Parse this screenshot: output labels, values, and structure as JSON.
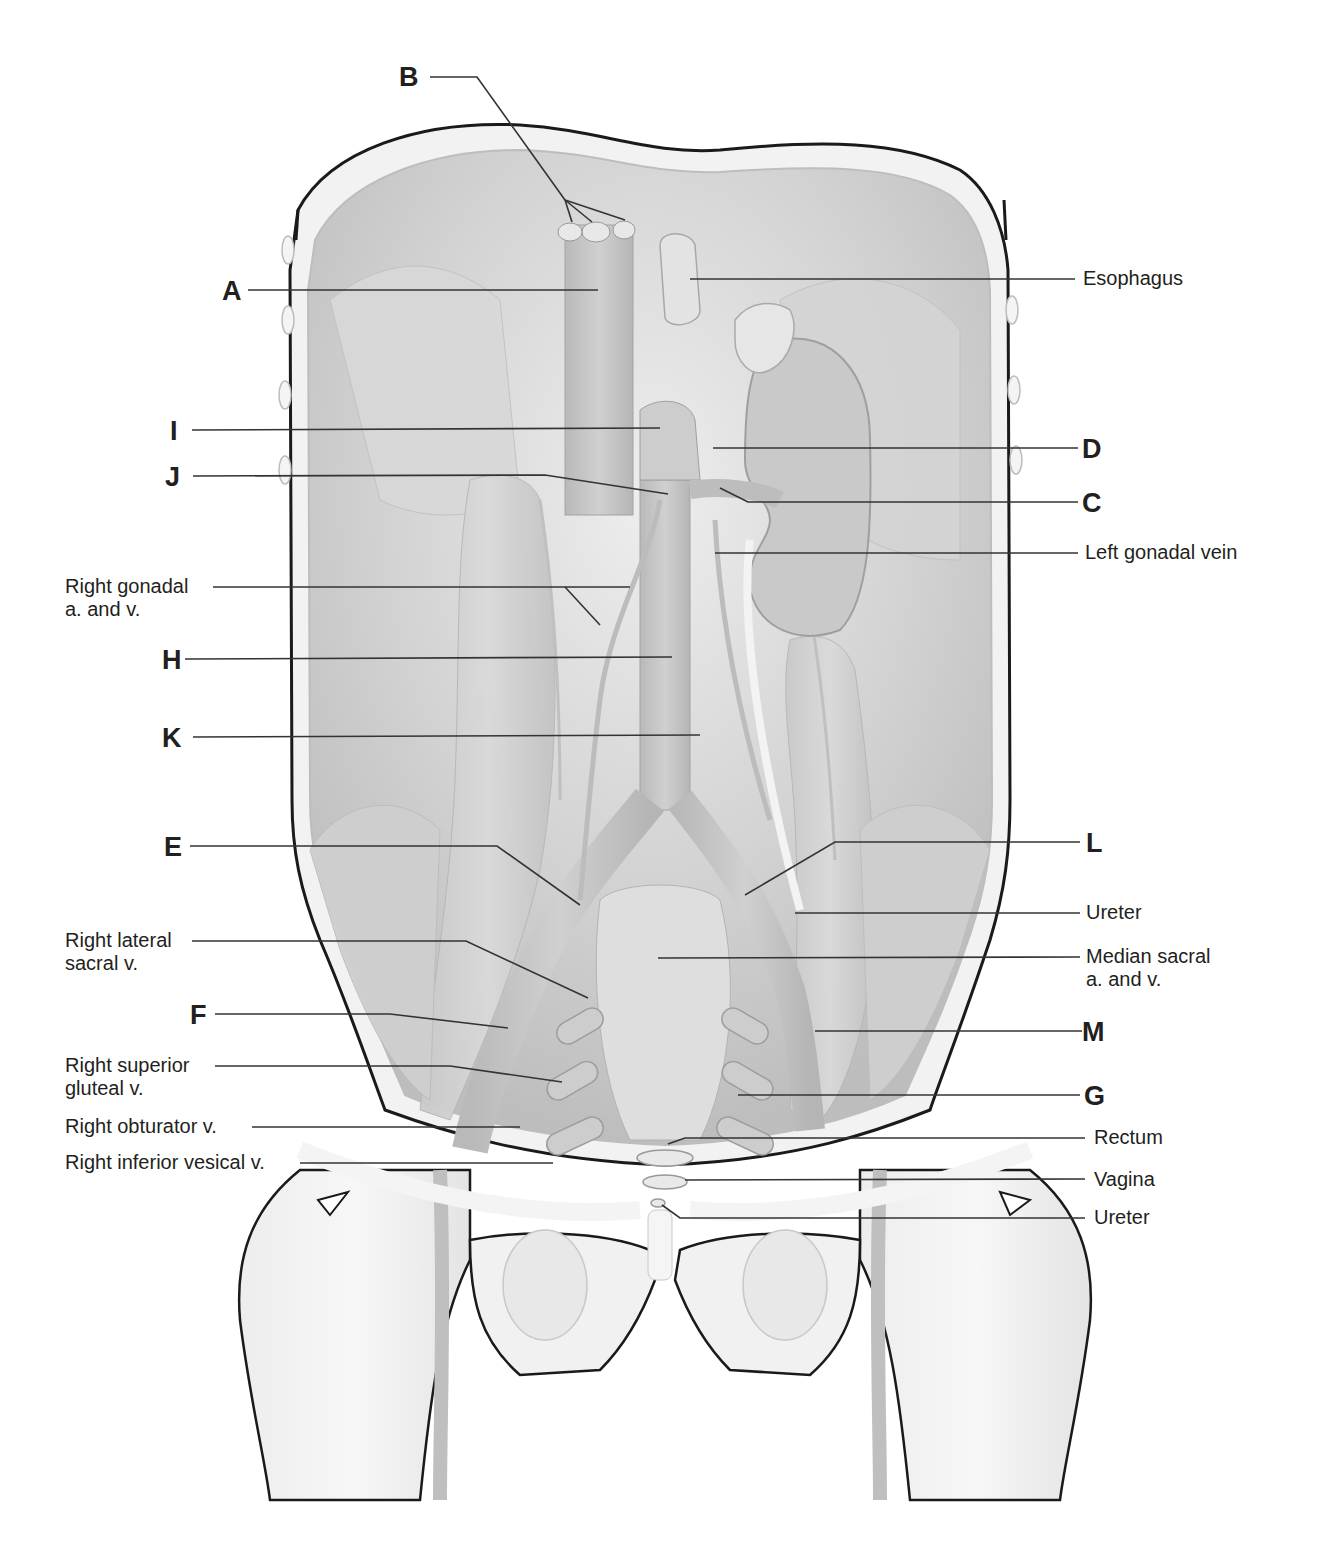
{
  "figure": {
    "colors": {
      "background": "#ffffff",
      "outline": "#1a1a1a",
      "tissue_light": "#e6e6e6",
      "tissue_mid": "#cfcfcf",
      "tissue_dark": "#b3b3b3",
      "vessel": "#c4c4c4",
      "leader_line": "#333333",
      "text": "#231f20"
    }
  },
  "letter_labels": [
    {
      "id": "A",
      "text": "A"
    },
    {
      "id": "B",
      "text": "B"
    },
    {
      "id": "C",
      "text": "C"
    },
    {
      "id": "D",
      "text": "D"
    },
    {
      "id": "E",
      "text": "E"
    },
    {
      "id": "F",
      "text": "F"
    },
    {
      "id": "G",
      "text": "G"
    },
    {
      "id": "H",
      "text": "H"
    },
    {
      "id": "I",
      "text": "I"
    },
    {
      "id": "J",
      "text": "J"
    },
    {
      "id": "K",
      "text": "K"
    },
    {
      "id": "L",
      "text": "L"
    },
    {
      "id": "M",
      "text": "M"
    }
  ],
  "text_labels": {
    "esophagus": "Esophagus",
    "left_gonadal_vein": "Left gonadal vein",
    "right_gonadal": [
      "Right gonadal",
      "a. and v."
    ],
    "right_lateral_sacral": [
      "Right lateral",
      "sacral v."
    ],
    "right_superior_gluteal": [
      "Right superior",
      "gluteal v."
    ],
    "right_obturator": "Right obturator v.",
    "right_inferior_vesical": "Right inferior vesical v.",
    "ureter_upper": "Ureter",
    "median_sacral": [
      "Median sacral",
      "a. and v."
    ],
    "rectum": "Rectum",
    "vagina": "Vagina",
    "ureter_lower": "Ureter"
  }
}
